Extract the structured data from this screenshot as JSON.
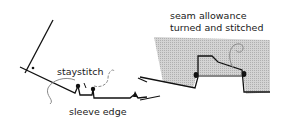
{
  "figure": {
    "left_panel": {
      "labels": {
        "staystitch": "staystitch",
        "sleeve_edge": "sleeve edge"
      }
    },
    "right_panel": {
      "labels": {
        "line1": "seam allowance",
        "line2": "turned and stitched"
      }
    },
    "colors": {
      "ink": "#111111",
      "shading": "#c8c8c8",
      "thread": "#8a8a8a"
    }
  }
}
